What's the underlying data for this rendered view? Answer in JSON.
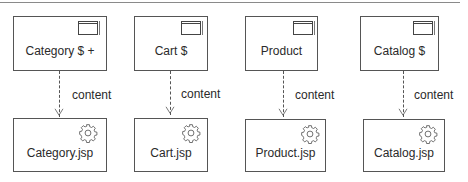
{
  "diagram": {
    "top_nodes": [
      {
        "label": "Category $ +",
        "icon": "window-icon"
      },
      {
        "label": "Cart $",
        "icon": "window-icon"
      },
      {
        "label": "Product",
        "icon": "window-icon"
      },
      {
        "label": "Catalog $",
        "icon": "window-icon"
      }
    ],
    "bottom_nodes": [
      {
        "label": "Category.jsp",
        "icon": "gear-icon"
      },
      {
        "label": "Cart.jsp",
        "icon": "gear-icon"
      },
      {
        "label": "Product.jsp",
        "icon": "gear-icon"
      },
      {
        "label": "Catalog.jsp",
        "icon": "gear-icon"
      }
    ],
    "connectors": [
      {
        "label": "content",
        "style": "dashed",
        "arrow": "open"
      },
      {
        "label": "content",
        "style": "dashed",
        "arrow": "open"
      },
      {
        "label": "content",
        "style": "dashed",
        "arrow": "open"
      },
      {
        "label": "content",
        "style": "dashed",
        "arrow": "open"
      }
    ]
  }
}
